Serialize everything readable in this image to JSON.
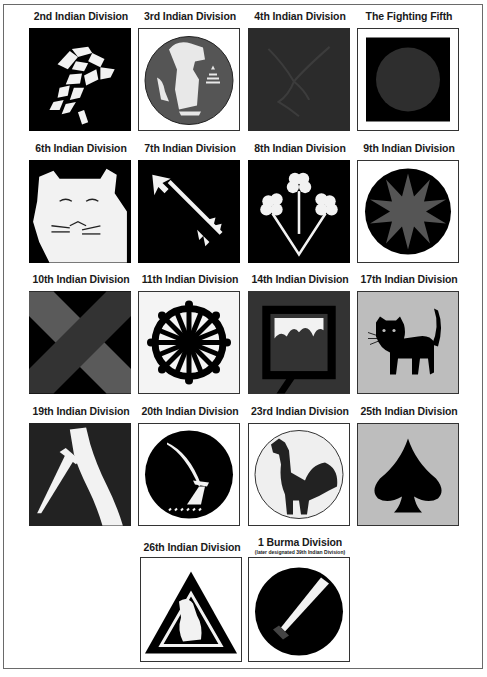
{
  "divisions": [
    {
      "label": "2nd Indian Division",
      "emblem": "crossed-keys-icon",
      "bg": "#000000",
      "fg": "#f2f2f2"
    },
    {
      "label": "3rd Indian Division",
      "emblem": "dog-on-disc-icon",
      "bg": "#ffffff",
      "fg": "#555555"
    },
    {
      "label": "4th Indian Division",
      "emblem": "eagle-icon",
      "bg": "#2b2b2b",
      "fg": "#3a3a3a"
    },
    {
      "label": "The Fighting Fifth",
      "emblem": "disc-on-square-icon",
      "bg": "#000000",
      "fg": "#2e2e2e"
    },
    {
      "label": "6th Indian Division",
      "emblem": "tiger-head-icon",
      "bg": "#000000",
      "fg": "#f2f2f2"
    },
    {
      "label": "7th Indian Division",
      "emblem": "arrow-icon",
      "bg": "#000000",
      "fg": "#f2f2f2"
    },
    {
      "label": "8th Indian Division",
      "emblem": "three-clovers-icon",
      "bg": "#000000",
      "fg": "#f2f2f2"
    },
    {
      "label": "9th Indian Division",
      "emblem": "star-on-disc-icon",
      "bg": "#000000",
      "fg": "#555555"
    },
    {
      "label": "10th Indian Division",
      "emblem": "saltire-icon",
      "bg": "#000000",
      "fg": "#555555"
    },
    {
      "label": "11th Indian Division",
      "emblem": "wheel-icon",
      "bg": "#f4f4f4",
      "fg": "#000000"
    },
    {
      "label": "14th Indian Division",
      "emblem": "framed-picture-icon",
      "bg": "#333333",
      "fg": "#000000"
    },
    {
      "label": "17th Indian Division",
      "emblem": "black-cat-icon",
      "bg": "#bdbdbd",
      "fg": "#000000"
    },
    {
      "label": "19th Indian Division",
      "emblem": "dagger-hand-icon",
      "bg": "#222222",
      "fg": "#f2f2f2"
    },
    {
      "label": "20th Indian Division",
      "emblem": "sword-on-disc-icon",
      "bg": "#ffffff",
      "fg": "#000000"
    },
    {
      "label": "23rd Indian Division",
      "emblem": "rooster-icon",
      "bg": "#ffffff",
      "fg": "#222222"
    },
    {
      "label": "25th Indian Division",
      "emblem": "spade-icon",
      "bg": "#bdbdbd",
      "fg": "#000000"
    },
    {
      "label": "26th Indian Division",
      "emblem": "tiger-triangle-icon",
      "bg": "#ffffff",
      "fg": "#000000"
    },
    {
      "label": "1 Burma Division",
      "sublabel": "(later designated 39th Indian Division)",
      "emblem": "dah-sword-on-disc-icon",
      "bg": "#ffffff",
      "fg": "#000000"
    }
  ]
}
